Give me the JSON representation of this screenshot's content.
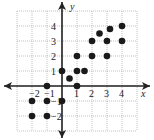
{
  "chart_data": {
    "type": "scatter",
    "title": "",
    "xlabel": "x",
    "ylabel": "y",
    "xlim": [
      -3,
      5
    ],
    "ylim": [
      -3,
      5
    ],
    "grid": true,
    "x_ticks": [
      -2,
      -1,
      1,
      2,
      3,
      4
    ],
    "y_ticks": [
      -2,
      -1,
      1,
      2,
      3,
      4
    ],
    "points": [
      {
        "x": -2,
        "y": -1
      },
      {
        "x": -1,
        "y": -1
      },
      {
        "x": -2,
        "y": -2
      },
      {
        "x": -1,
        "y": -2
      },
      {
        "x": 0,
        "y": -1
      },
      {
        "x": -1,
        "y": 0
      },
      {
        "x": 0,
        "y": 1
      },
      {
        "x": 0.5,
        "y": 0.5
      },
      {
        "x": 1,
        "y": 0
      },
      {
        "x": 1,
        "y": 1
      },
      {
        "x": 1.5,
        "y": 1
      },
      {
        "x": 1,
        "y": 2
      },
      {
        "x": 2,
        "y": 2
      },
      {
        "x": 2,
        "y": 3
      },
      {
        "x": 2.5,
        "y": 3.5
      },
      {
        "x": 3,
        "y": 2
      },
      {
        "x": 3,
        "y": 3
      },
      {
        "x": 3.2,
        "y": 3.8
      },
      {
        "x": 4,
        "y": 3
      },
      {
        "x": 4,
        "y": 4
      }
    ]
  },
  "axes": {
    "x_label": "x",
    "y_label": "y"
  },
  "colors": {
    "grid": "#999999",
    "axis": "#222222",
    "point": "#1a1a1a"
  }
}
